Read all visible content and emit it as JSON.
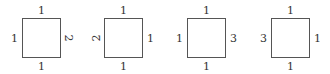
{
  "squares": [
    {
      "top": "1",
      "left": "1",
      "right": "2",
      "bottom": "1"
    },
    {
      "top": "1",
      "left": "2",
      "right": "1",
      "bottom": "1"
    },
    {
      "top": "1",
      "left": "1",
      "right": "3",
      "bottom": "1"
    },
    {
      "top": "1",
      "left": "3",
      "right": "1",
      "bottom": "1"
    }
  ]
}
